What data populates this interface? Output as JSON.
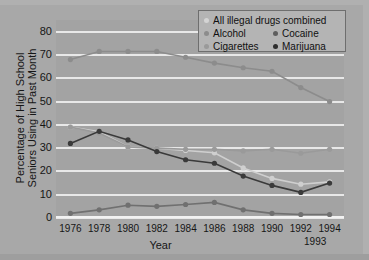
{
  "chart_data": {
    "type": "line",
    "title": "",
    "xlabel": "Year",
    "ylabel": "Percentage of High School Seniors Using in Past Month",
    "ylabel_line1": "Percentage of High School",
    "ylabel_line2": "Seniors Using in Past Month",
    "grid": true,
    "legend_position": "top-right",
    "xlim": [
      1975,
      1995
    ],
    "ylim": [
      0,
      85
    ],
    "yticks": [
      0,
      10,
      20,
      30,
      40,
      50,
      60,
      70,
      80
    ],
    "ytick_labels": [
      "0",
      "10",
      "20",
      "30",
      "40",
      "50",
      "60",
      "70",
      "80"
    ],
    "xticks": [
      1976,
      1978,
      1980,
      1982,
      1984,
      1986,
      1988,
      1990,
      1992,
      1994
    ],
    "xtick_labels": [
      "1976",
      "1978",
      "1980",
      "1982",
      "1984",
      "1986",
      "1988",
      "1990",
      "1992",
      "1994"
    ],
    "xtick_sub_label": "1993",
    "x": [
      1976,
      1978,
      1980,
      1982,
      1984,
      1986,
      1988,
      1990,
      1992,
      1994
    ],
    "series": [
      {
        "name": "All illegal drugs combined",
        "color": "#cfcfcf",
        "marker": "circle",
        "values": [
          39.0,
          37.0,
          30.5,
          30.0,
          29.0,
          28.0,
          21.5,
          17.0,
          14.5,
          15.5
        ]
      },
      {
        "name": "Alcohol",
        "color": "#8c8c8c",
        "marker": "circle",
        "values": [
          68.0,
          71.5,
          71.5,
          71.5,
          69.0,
          66.5,
          64.5,
          63.0,
          56.0,
          50.0
        ]
      },
      {
        "name": "Cocaine",
        "color": "#707070",
        "marker": "circle",
        "values": [
          2.0,
          3.5,
          5.5,
          5.0,
          5.8,
          6.7,
          3.5,
          2.0,
          1.5,
          1.5
        ]
      },
      {
        "name": "Cigarettes",
        "color": "#9a9a9a",
        "marker": "circle",
        "values": [
          39.0,
          36.5,
          30.5,
          30.0,
          29.5,
          29.5,
          28.8,
          29.5,
          27.8,
          29.5
        ]
      },
      {
        "name": "Marijuana",
        "color": "#3a3a3a",
        "marker": "circle",
        "values": [
          32.0,
          37.2,
          33.5,
          28.5,
          25.0,
          23.5,
          18.0,
          14.0,
          11.0,
          15.0
        ]
      }
    ]
  },
  "legend": {
    "rows": [
      [
        {
          "label": "All illegal drugs combined",
          "color": "#d4d4d4"
        }
      ],
      [
        {
          "label": "Alcohol",
          "color": "#8c8c8c"
        },
        {
          "label": "Cocaine",
          "color": "#5e5e5e"
        }
      ],
      [
        {
          "label": "Cigarettes",
          "color": "#9a9a9a"
        },
        {
          "label": "Marijuana",
          "color": "#2e2e2e"
        }
      ]
    ]
  }
}
